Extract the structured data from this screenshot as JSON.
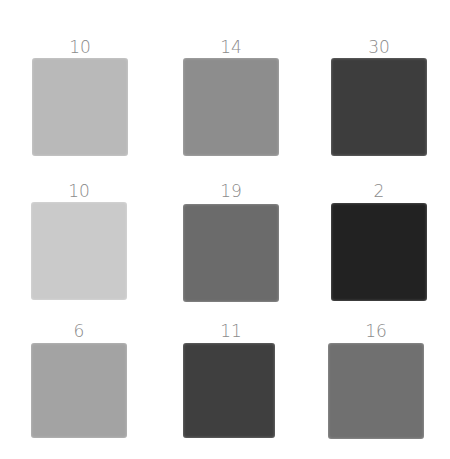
{
  "grid": {
    "rows": 3,
    "cols": 3,
    "cells": [
      {
        "label": "10",
        "color": "#b9b9b9"
      },
      {
        "label": "14",
        "color": "#8d8d8d"
      },
      {
        "label": "30",
        "color": "#3d3d3d"
      },
      {
        "label": "10",
        "color": "#cacaca"
      },
      {
        "label": "19",
        "color": "#6b6b6b"
      },
      {
        "label": "2",
        "color": "#222222"
      },
      {
        "label": "6",
        "color": "#a3a3a3"
      },
      {
        "label": "11",
        "color": "#3f3f3f"
      },
      {
        "label": "16",
        "color": "#707070"
      }
    ]
  }
}
